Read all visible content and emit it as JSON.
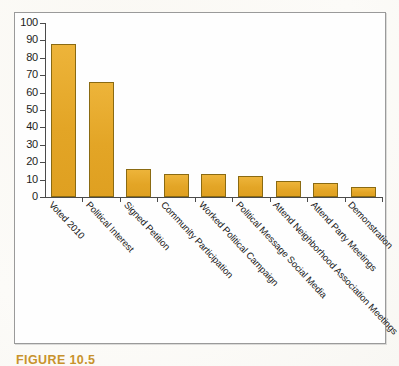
{
  "figure": {
    "caption": "FIGURE 10.5",
    "caption_color": "#c8922c"
  },
  "chart_data": {
    "type": "bar",
    "title": "",
    "xlabel": "",
    "ylabel": "",
    "ylim": [
      0,
      100
    ],
    "ytick_step": 10,
    "yticks": [
      "100",
      "90",
      "80",
      "70",
      "60",
      "50",
      "40",
      "30",
      "20",
      "10",
      "0"
    ],
    "grid": false,
    "legend": null,
    "bar_color": "#e3a526",
    "bar_edge_color": "#8a6a12",
    "categories": [
      "Voted 2010",
      "Political Interest",
      "Signed Petition",
      "Community Participation",
      "Worked Political Campaign",
      "Political Message Social Media",
      "Attend Neighborhood Association Meetings",
      "Attend Party Meetings",
      "Demonstration"
    ],
    "values": [
      88,
      66,
      16,
      13,
      13,
      12,
      9,
      8,
      6
    ]
  }
}
